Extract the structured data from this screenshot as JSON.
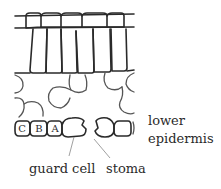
{
  "diagram": {
    "labels": {
      "lower_epidermis_line1": "lower",
      "lower_epidermis_line2": "epidermis",
      "guard_cell": "guard cell",
      "stoma": "stoma"
    },
    "cell_letters": [
      "C",
      "B",
      "A"
    ],
    "colors": {
      "stroke": "#2a2a2a",
      "leader": "#888888",
      "background": "#ffffff"
    }
  }
}
